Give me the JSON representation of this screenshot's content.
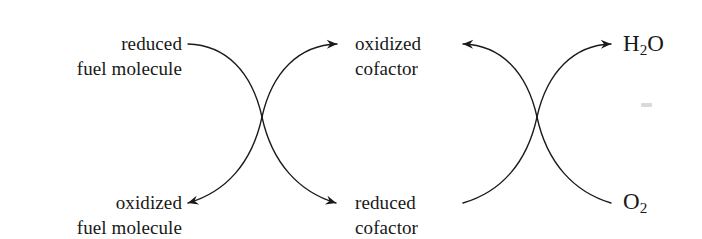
{
  "figure": {
    "background_color": "#ffffff",
    "stroke_color": "#1a1a1a",
    "width": 702,
    "height": 239
  },
  "labels": {
    "top_left": {
      "line1": "reduced",
      "line2": "fuel molecule"
    },
    "bottom_left": {
      "line1": "oxidized",
      "line2": "fuel molecule"
    },
    "top_middle": {
      "line1": "oxidized",
      "line2": "cofactor"
    },
    "bottom_middle": {
      "line1": "reduced",
      "line2": "cofactor"
    },
    "top_right": {
      "formula": "H",
      "subscript": "2",
      "formula_tail": "O"
    },
    "bottom_right": {
      "formula": "O",
      "subscript": "2",
      "formula_tail": ""
    }
  },
  "arrows": {
    "left_crossover": {
      "in_top_left": "reduced fuel molecule enters (no arrowhead)",
      "out_bottom_left": "oxidized fuel molecule exits (left arrowhead)",
      "out_top_right": "oxidized cofactor exits (left arrowhead)",
      "out_bottom_right": "reduced cofactor exits (right arrowhead)"
    },
    "right_crossover": {
      "out_top_left": "oxidized cofactor exits (left arrowhead)",
      "in_bottom_left": "reduced cofactor enters (no arrowhead)",
      "out_top_right": "H2O exits (right arrowhead)",
      "in_bottom_right": "O2 enters (no arrowhead)"
    }
  }
}
